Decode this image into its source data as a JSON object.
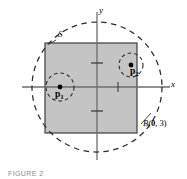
{
  "figure": {
    "caption": "FIGURE 2",
    "axes": {
      "x_label": "x",
      "y_label": "y",
      "origin_px": [
        97,
        87
      ],
      "x_axis_span_px": [
        22,
        170
      ],
      "y_axis_span_px": [
        12,
        160
      ],
      "x_ticks_px": [
        118
      ],
      "y_ticks_px": [
        63,
        111
      ]
    },
    "set_label": "S",
    "ball_label_prefix": "B(",
    "ball_label_center": "0",
    "ball_label_sep": ", ",
    "ball_label_radius": "3",
    "ball_label_suffix": ")",
    "points": [
      {
        "label": "p",
        "subscript": "1",
        "x_px": 60,
        "y_px": 87,
        "nbhd_radius_px": 14
      },
      {
        "label": "p",
        "subscript": "2",
        "x_px": 131,
        "y_px": 65,
        "nbhd_radius_px": 12
      }
    ],
    "square": {
      "x_px": 45,
      "y_px": 43,
      "width_px": 92,
      "height_px": 90
    },
    "big_circle": {
      "cx_px": 97,
      "cy_px": 87,
      "r_px": 65
    },
    "colors": {
      "square_fill": "#c4c4c4",
      "square_stroke": "#3d3d3d",
      "axis_stroke": "#6e6e6e",
      "dashed_stroke": "#2b2b2b",
      "point_fill": "#000000",
      "background": "#ffffff",
      "caption_color": "#8d8d8d"
    }
  }
}
